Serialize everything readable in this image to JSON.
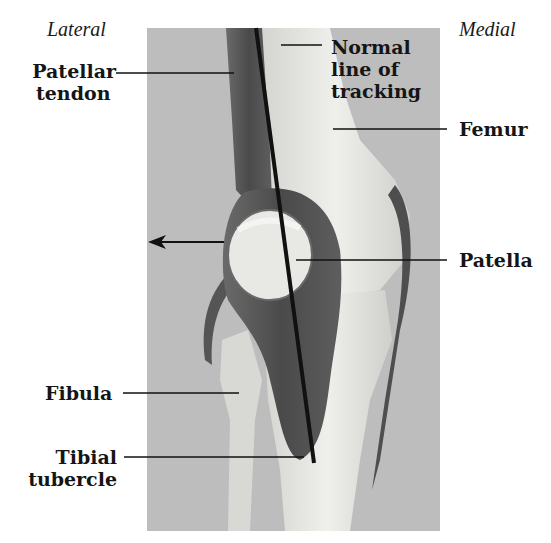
{
  "figure": {
    "orientation": {
      "left": "Lateral",
      "right": "Medial"
    },
    "labels": {
      "patellar_tendon": [
        "Patellar",
        "tendon"
      ],
      "normal_line": [
        "Normal",
        "line of",
        "tracking"
      ],
      "femur": "Femur",
      "patella": "Patella",
      "fibula": "Fibula",
      "tibial_tubercle": [
        "Tibial",
        "tubercle"
      ]
    },
    "arrow": {
      "direction": "left",
      "meaning": "lateral displacement of patella"
    },
    "colors": {
      "background": "#bdbdbd",
      "bone": "#e6e6e2",
      "tendon": "#555555",
      "line": "#111111"
    }
  }
}
